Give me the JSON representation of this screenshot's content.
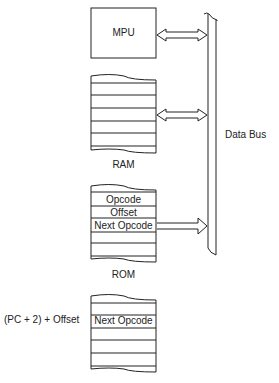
{
  "diagram": {
    "mpu": {
      "label": "MPU"
    },
    "ram": {
      "label": "RAM"
    },
    "rom": {
      "label": "ROM",
      "cells": [
        "Opcode",
        "Offset",
        "Next Opcode"
      ]
    },
    "target": {
      "address_label": "(PC + 2) + Offset",
      "cells": [
        "Next Opcode"
      ]
    },
    "bus": {
      "label": "Data Bus"
    },
    "arrows": [
      {
        "from": "MPU",
        "to": "Data Bus",
        "type": "bidirectional"
      },
      {
        "from": "RAM",
        "to": "Data Bus",
        "type": "bidirectional"
      },
      {
        "from": "ROM",
        "to": "Data Bus",
        "type": "unidirectional"
      }
    ],
    "colors": {
      "stroke": "#222222",
      "background": "#ffffff"
    }
  }
}
